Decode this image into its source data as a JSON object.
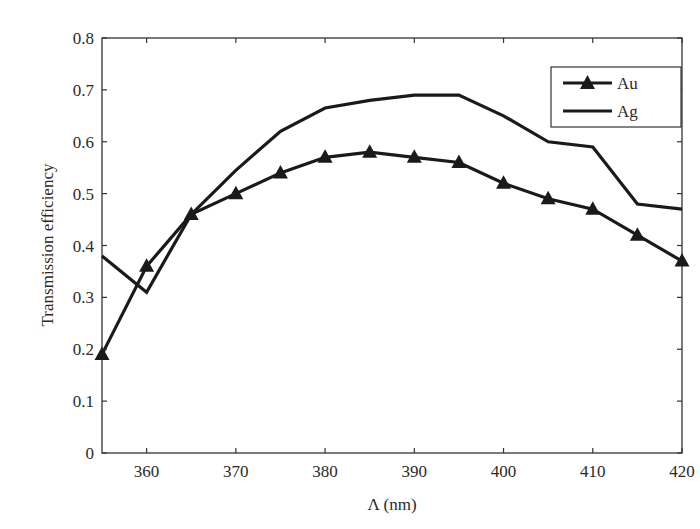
{
  "chart_data": {
    "type": "line",
    "title": "",
    "xlabel": "Λ (nm)",
    "ylabel": "Transmission efficiency",
    "x": [
      355,
      360,
      365,
      370,
      375,
      380,
      385,
      390,
      395,
      400,
      405,
      410,
      415,
      420
    ],
    "xlim": [
      355,
      420
    ],
    "ylim": [
      0,
      0.8
    ],
    "xticks": [
      360,
      370,
      380,
      390,
      400,
      410,
      420
    ],
    "yticks": [
      0,
      0.1,
      0.2,
      0.3,
      0.4,
      0.5,
      0.6,
      0.7,
      0.8
    ],
    "xtick_labels": [
      "360",
      "370",
      "380",
      "390",
      "400",
      "410",
      "420"
    ],
    "ytick_labels": [
      "0",
      "0.1",
      "0.2",
      "0.3",
      "0.4",
      "0.5",
      "0.6",
      "0.7",
      "0.8"
    ],
    "grid": false,
    "legend_position": "upper right",
    "series": [
      {
        "name": "Au",
        "marker": "triangle",
        "values": [
          0.19,
          0.36,
          0.46,
          0.5,
          0.54,
          0.57,
          0.58,
          0.57,
          0.56,
          0.52,
          0.49,
          0.47,
          0.42,
          0.37
        ]
      },
      {
        "name": "Ag",
        "marker": "none",
        "values": [
          0.38,
          0.31,
          0.46,
          0.545,
          0.62,
          0.665,
          0.68,
          0.69,
          0.69,
          0.65,
          0.6,
          0.59,
          0.48,
          0.47
        ]
      }
    ]
  },
  "legend": {
    "items": [
      {
        "label": "Au"
      },
      {
        "label": "Ag"
      }
    ]
  },
  "axes": {
    "xlabel": "Λ (nm)",
    "ylabel": "Transmission efficiency"
  },
  "colors": {
    "line": "#1a1a1a",
    "axis": "#333333"
  }
}
